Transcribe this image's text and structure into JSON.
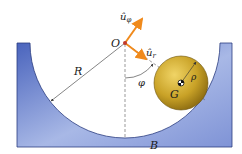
{
  "labels": {
    "origin": "O",
    "radius_outer": "R",
    "radius_ball": "ρ",
    "center_mass": "G",
    "angle": "φ",
    "bottom_point": "B",
    "unit_r": "û",
    "unit_r_sub": "r",
    "unit_phi": "û",
    "unit_phi_sub": "φ"
  },
  "colors": {
    "container_dark": "#5a72c4",
    "container_light": "#dde4f6",
    "ball": "#c9a227",
    "ball_highlight": "#e8c84a",
    "ball_shadow": "#8a6a10",
    "vector": "#f08a1c",
    "origin_dot": "#c0392b"
  }
}
